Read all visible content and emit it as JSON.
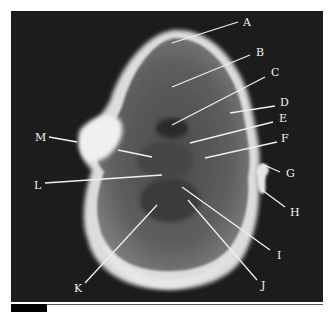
{
  "figure": {
    "type": "axial MRI section of head/neck",
    "background_color": "#1c1c1c",
    "label_color": "#f2f2f2",
    "labels": [
      {
        "letter": "A",
        "x": 243,
        "y": 17,
        "line": [
          172,
          43,
          238,
          22
        ]
      },
      {
        "letter": "B",
        "x": 256,
        "y": 47,
        "line": [
          172,
          87,
          250,
          55
        ]
      },
      {
        "letter": "C",
        "x": 271,
        "y": 67,
        "line": [
          172,
          125,
          265,
          77
        ]
      },
      {
        "letter": "D",
        "x": 280,
        "y": 97,
        "line": [
          230,
          113,
          275,
          106
        ]
      },
      {
        "letter": "E",
        "x": 279,
        "y": 113,
        "line": [
          190,
          143,
          273,
          122
        ]
      },
      {
        "letter": "F",
        "x": 281,
        "y": 133,
        "line": [
          205,
          158,
          277,
          142
        ]
      },
      {
        "letter": "G",
        "x": 286,
        "y": 168,
        "line": [
          262,
          164,
          280,
          172
        ]
      },
      {
        "letter": "H",
        "x": 290,
        "y": 207,
        "line": [
          262,
          190,
          285,
          207
        ]
      },
      {
        "letter": "I",
        "x": 276,
        "y": 250,
        "line": [
          182,
          187,
          270,
          250
        ]
      },
      {
        "letter": "J",
        "x": 261,
        "y": 280,
        "line": [
          188,
          200,
          257,
          280
        ]
      },
      {
        "letter": "K",
        "x": 74,
        "y": 283,
        "line": [
          157,
          205,
          85,
          283
        ]
      },
      {
        "letter": "L",
        "x": 33,
        "y": 180,
        "line": [
          162,
          175,
          45,
          183
        ]
      },
      {
        "letter": "M",
        "x": 36,
        "y": 132,
        "line": [
          77,
          142,
          49,
          137
        ]
      }
    ],
    "extra_lines": [
      [
        118,
        150,
        152,
        157
      ]
    ]
  }
}
